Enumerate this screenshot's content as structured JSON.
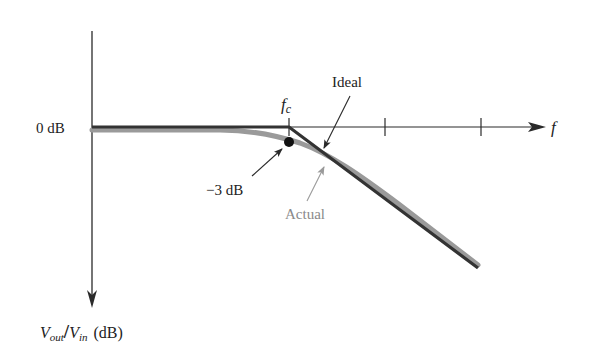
{
  "diagram": {
    "labels": {
      "zero_db": "0 dB",
      "fc_main": "f",
      "fc_sub": "c",
      "f_axis": "f",
      "ideal": "Ideal",
      "actual": "Actual",
      "minus3db": "−3 dB",
      "y_axis_vout": "V",
      "y_axis_vout_sub": "out",
      "y_axis_slash": "/",
      "y_axis_vin": "V",
      "y_axis_vin_sub": "in",
      "y_axis_unit": "(dB)"
    },
    "colors": {
      "axis": "#2a2a2a",
      "ideal_line": "#333333",
      "actual_line": "#9a9a9a",
      "actual_label": "#8a8a8a",
      "text": "#222222"
    },
    "curves": {
      "ideal": "Flat at 0 dB until fc, then straight roll-off",
      "actual": "Gradual roll-off, passes through -3 dB at fc, converges with ideal asymptote"
    },
    "x_axis_ticks": 3
  }
}
